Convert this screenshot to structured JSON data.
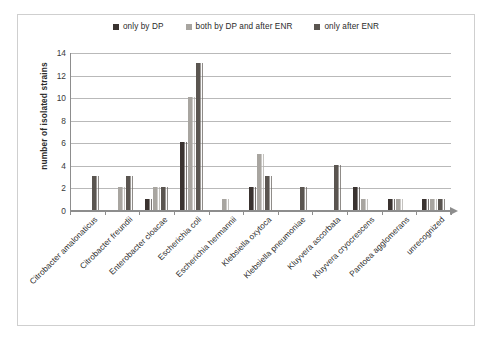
{
  "chart_data": {
    "type": "bar",
    "title": "",
    "subtitle": "",
    "xlabel": "",
    "ylabel": "number of isolated strains",
    "ylim": [
      0,
      14
    ],
    "ytick_step": 2,
    "yticks": [
      14,
      12,
      10,
      8,
      6,
      4,
      2,
      0
    ],
    "grid": true,
    "legend_position": "top-center",
    "categories": [
      "Citrobacter amalonaticus",
      "Citrobacter freundii",
      "Enterobacter cloacae",
      "Escherichia coli",
      "Escherichia hermannii",
      "Klebsiella oxytoca",
      "Klebsiella pneumoniae",
      "Kluyvera ascorbata",
      "Kluyvera cryocrescens",
      "Pantoea agglomerans",
      "unrecognized"
    ],
    "series": [
      {
        "name": "only by DP",
        "color": "#3a3330",
        "values": [
          0,
          0,
          1,
          6,
          0,
          2,
          0,
          0,
          2,
          1,
          1
        ]
      },
      {
        "name": "both by DP and after ENR",
        "color": "#a8a5a0",
        "values": [
          0,
          2,
          2,
          10,
          1,
          5,
          0,
          0,
          1,
          1,
          1
        ]
      },
      {
        "name": "only after ENR",
        "color": "#5a5550",
        "values": [
          3,
          3,
          2,
          13,
          0,
          3,
          2,
          4,
          0,
          0,
          1
        ]
      }
    ]
  },
  "colors": {
    "series_1": "#3a3330",
    "series_2": "#a8a5a0",
    "series_3": "#5a5550",
    "gridline": "#b9b9b9",
    "axis": "#8d8d8d",
    "frame": "#cfcfcf",
    "text": "#2b2b2b",
    "background": "#ffffff"
  }
}
